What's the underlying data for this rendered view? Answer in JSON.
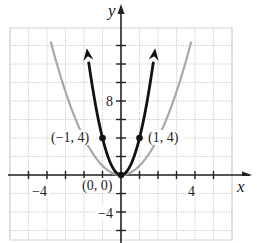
{
  "chart_data": {
    "type": "line",
    "title": "",
    "xlabel": "x",
    "ylabel": "y",
    "xlim": [
      -6,
      6
    ],
    "ylim": [
      -6,
      16
    ],
    "grid": true,
    "x_tick_labels": [
      "-4",
      "4"
    ],
    "y_tick_labels": [
      "8",
      "-4"
    ],
    "series": [
      {
        "name": "y = 4x^2",
        "color": "#111111",
        "style": "bold",
        "x_range": [
          -1.9,
          1.9
        ],
        "points": [
          [
            -1.9,
            14.44
          ],
          [
            -1,
            4
          ],
          [
            0,
            0
          ],
          [
            1,
            4
          ],
          [
            1.9,
            14.44
          ]
        ],
        "arrows": true
      },
      {
        "name": "y = x^2",
        "color": "#a8a8a8",
        "style": "light",
        "x_range": [
          -3.8,
          3.8
        ],
        "points": [
          [
            -3.8,
            14.44
          ],
          [
            -2,
            4
          ],
          [
            0,
            0
          ],
          [
            2,
            4
          ],
          [
            3.8,
            14.44
          ]
        ],
        "arrows": false
      }
    ],
    "annotations": [
      {
        "text": "(-1, 4)",
        "x": -1,
        "y": 4
      },
      {
        "text": "(1, 4)",
        "x": 1,
        "y": 4
      },
      {
        "text": "(0, 0)",
        "x": 0,
        "y": 0
      }
    ]
  },
  "labels": {
    "x_axis": "x",
    "y_axis": "y",
    "tick_x_neg4": "−4",
    "tick_x_4": "4",
    "tick_y_8": "8",
    "tick_y_neg4": "−4",
    "pt_left": "(−1, 4)",
    "pt_right": "(1, 4)",
    "pt_origin": "(0, 0)"
  }
}
